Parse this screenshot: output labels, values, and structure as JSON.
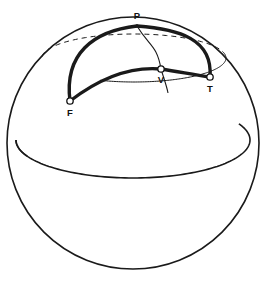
{
  "figure": {
    "background_color": "#ffffff",
    "stroke_color": "#1a1a1a",
    "canvas": {
      "width": 267,
      "height": 287
    }
  },
  "sphere": {
    "name": "sphere-outline",
    "center_x": 133,
    "center_y": 143,
    "radius": 126,
    "line_width": 1.6
  },
  "equator": {
    "name": "equator",
    "center_x": 133,
    "center_y": 140,
    "rx": 117,
    "ry": 38,
    "line_width": 1.6,
    "front_visible": true,
    "back_visible_stubs": true
  },
  "latitude_circle": {
    "name": "latitude-circle",
    "center_x": 134,
    "center_y": 58,
    "rx": 92,
    "ry": 24,
    "line_width": 1.0,
    "back_style": "dashed",
    "front_style": "solid",
    "dash_pattern": "5,4"
  },
  "meridian": {
    "name": "meridian-through-v",
    "line_width": 1.1,
    "from": "P",
    "through": "V"
  },
  "points": [
    {
      "id": "P",
      "label": "P",
      "x": 137,
      "y": 26,
      "label_x": 137,
      "label_y": 16,
      "marker": "none",
      "role": "pole"
    },
    {
      "id": "V",
      "label": "V",
      "x": 161,
      "y": 69,
      "label_x": 161,
      "label_y": 80,
      "marker": "open-circle",
      "role": "vertex"
    },
    {
      "id": "T",
      "label": "T",
      "x": 210,
      "y": 77,
      "label_x": 210,
      "label_y": 89,
      "marker": "open-circle",
      "role": "vertex"
    },
    {
      "id": "F",
      "label": "F",
      "x": 70,
      "y": 101,
      "label_x": 70,
      "label_y": 113,
      "marker": "open-circle",
      "role": "vertex"
    }
  ],
  "marker_style": {
    "radius": 3.2,
    "fill": "#ffffff",
    "stroke": "#111111",
    "stroke_width": 1.3
  },
  "great_circle_arcs": [
    {
      "name": "arc-p-f",
      "from": "P",
      "to": "F",
      "line_width": 3.4,
      "style": "solid",
      "bulge": "outward-left"
    },
    {
      "name": "arc-p-t",
      "from": "P",
      "to": "T",
      "line_width": 3.4,
      "style": "solid",
      "bulge": "outward-right"
    },
    {
      "name": "arc-f-v-t",
      "from": "F",
      "to": "T",
      "through": "V",
      "line_width": 3.4,
      "style": "solid",
      "bulge": "upward"
    }
  ]
}
